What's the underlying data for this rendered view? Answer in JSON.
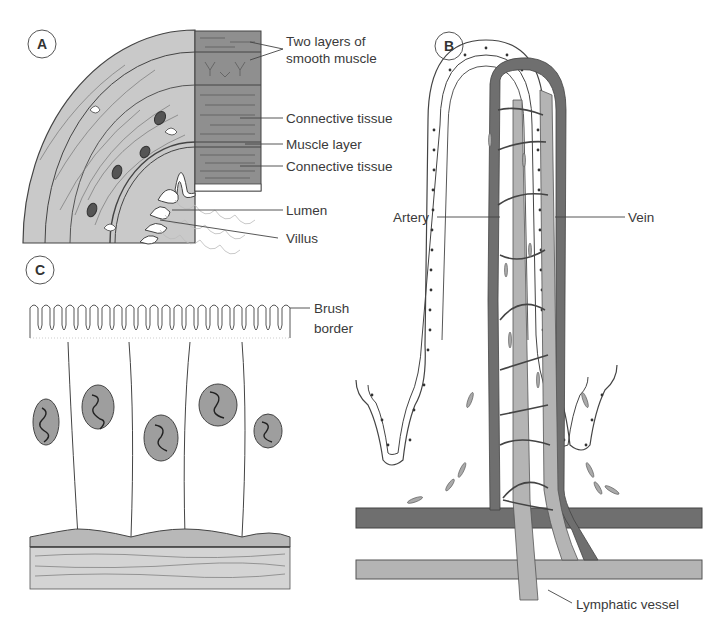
{
  "figure": {
    "panels": [
      {
        "id": "A",
        "label": "A",
        "description": "Quarter cross-section of small intestine wall",
        "annotations": [
          {
            "key": "two_layers",
            "line1": "Two layers of",
            "line2": "smooth muscle"
          },
          {
            "key": "connective_1",
            "text": "Connective tissue"
          },
          {
            "key": "muscle_layer",
            "text": "Muscle layer"
          },
          {
            "key": "connective_2",
            "text": "Connective tissue"
          },
          {
            "key": "lumen",
            "text": "Lumen"
          },
          {
            "key": "villus",
            "text": "Villus"
          }
        ]
      },
      {
        "id": "B",
        "label": "B",
        "description": "Longitudinal section of a villus with blood and lymphatic vessels",
        "annotations": [
          {
            "key": "artery",
            "text": "Artery"
          },
          {
            "key": "vein",
            "text": "Vein"
          },
          {
            "key": "lymphatic",
            "text": "Lymphatic vessel"
          }
        ]
      },
      {
        "id": "C",
        "label": "C",
        "description": "Columnar epithelial cells with brush border",
        "annotations": [
          {
            "key": "brush_border",
            "line1": "Brush",
            "line2": "border"
          }
        ]
      }
    ],
    "colors": {
      "outline": "#3a3a3a",
      "muscle_dark": "#8c8c8c",
      "tissue_light": "#c8c8c8",
      "tissue_mid": "#b0b0b0",
      "artery": "#6e6e6e",
      "vein_lymph": "#b4b4b4",
      "nucleus": "#9a9a9a"
    }
  }
}
